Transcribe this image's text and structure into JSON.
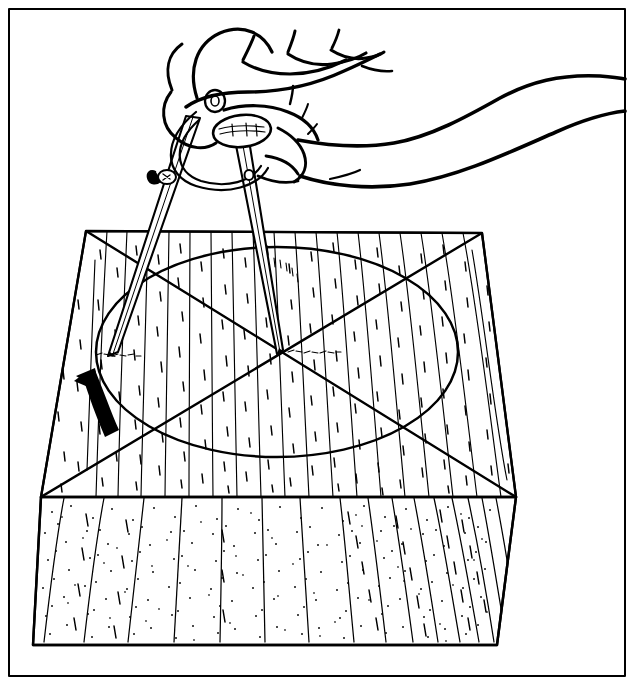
{
  "figure": {
    "title": "Scribing a circle on a wood block with dividers",
    "caption": "",
    "kind": "technical-line-illustration",
    "medium": "pen-and-ink line drawing, black on white",
    "border": {
      "present": true,
      "style": "thin rectangular rule inset from page edge",
      "color": "#000000",
      "inset_px": 8,
      "stroke_px": 2
    },
    "canvas": {
      "width": 634,
      "height": 685,
      "background": "#ffffff"
    }
  },
  "colors": {
    "ink": "#000000",
    "paper": "#ffffff",
    "stipple": "#1a1a1a",
    "arrow": "#000000"
  },
  "subjects": [
    {
      "id": "hand",
      "name": "hand-and-forearm",
      "label": "Right hand gripping the dividers",
      "description": "Outlined hand seen from the side, fingers curled over the tool head, forearm extending to the right edge of the frame"
    },
    {
      "id": "dividers",
      "name": "dividers-tool",
      "label": "Wing dividers / compass",
      "description": "Two-legged scribing compass with knurled top knob, pivot hinge, arc wing and thumbscrew"
    },
    {
      "id": "block",
      "name": "wood-block",
      "label": "Square wooden block",
      "description": "Thick square blank shown in perspective, top face with straight wood grain, stippled front edge"
    },
    {
      "id": "layout",
      "name": "layout-marks",
      "label": "Layout marks",
      "description": "Two corner-to-corner diagonals locating the centre, and the circle being scribed"
    },
    {
      "id": "arrow",
      "name": "rotation-arrow",
      "label": "Rotation direction arrow",
      "description": "Solid black curved arrow on the left of the top face indicating the sweep direction"
    }
  ],
  "tool_parts": [
    {
      "name": "top-knob",
      "label": "Knurled adjusting knob"
    },
    {
      "name": "pivot-hinge",
      "label": "Pivot hinge"
    },
    {
      "name": "wing-arc",
      "label": "Curved wing arc"
    },
    {
      "name": "thumbscrew",
      "label": "Locking thumbscrew"
    },
    {
      "name": "left-leg",
      "label": "Scribing leg"
    },
    {
      "name": "right-leg",
      "label": "Pivot leg"
    },
    {
      "name": "left-point",
      "label": "Scribing point"
    },
    {
      "name": "right-point",
      "label": "Centre point"
    }
  ],
  "geometry": {
    "block": {
      "top_face": [
        [
          41,
          497
        ],
        [
          86,
          231
        ],
        [
          482,
          233
        ],
        [
          516,
          497
        ]
      ],
      "front_face": [
        [
          41,
          497
        ],
        [
          516,
          497
        ],
        [
          497,
          645
        ],
        [
          33,
          645
        ]
      ],
      "top_back_left": [
        86,
        231
      ],
      "top_back_right": [
        482,
        233
      ],
      "top_front_left": [
        41,
        497
      ],
      "top_front_right": [
        516,
        497
      ]
    },
    "diagonals": [
      {
        "name": "diagonal-back-left-to-front-right",
        "from": [
          86,
          231
        ],
        "to": [
          516,
          497
        ]
      },
      {
        "name": "diagonal-back-right-to-front-left",
        "from": [
          482,
          233
        ],
        "to": [
          41,
          497
        ]
      }
    ],
    "center_point": [
      277,
      352
    ],
    "circle": {
      "name": "scribed-circle",
      "center": [
        277,
        352
      ],
      "rx": 181,
      "ry": 105,
      "note": "drawn as an ellipse because the top face is shown in perspective"
    },
    "arrow": {
      "name": "rotation-arrow",
      "tip": [
        80,
        382
      ],
      "tail": [
        115,
        428
      ],
      "direction": "counter-clockwise sweep, pointing up and to the left"
    },
    "divider_points": {
      "scribing_point": [
        108,
        355
      ],
      "center_point": [
        277,
        352
      ]
    }
  },
  "texture": {
    "top_face": {
      "style": "vertical wood-grain lines with short dashes",
      "grain_line_count": 21,
      "dash_count": 210
    },
    "front_face": {
      "style": "dense stipple with slanted grain streaks",
      "stipple_count": 1500,
      "streak_count": 26
    }
  }
}
